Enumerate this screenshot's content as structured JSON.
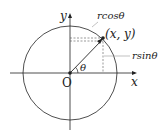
{
  "diagram": {
    "type": "unit-circle-polar-coordinates",
    "labels": {
      "x_axis": "x",
      "y_axis": "y",
      "origin": "O",
      "angle": "θ",
      "point": "(x, y)",
      "horizontal_projection": "rcosθ",
      "vertical_projection": "rsinθ"
    },
    "colors": {
      "stroke": "#222222",
      "dashed": "#555555",
      "leader": "#999999"
    }
  }
}
